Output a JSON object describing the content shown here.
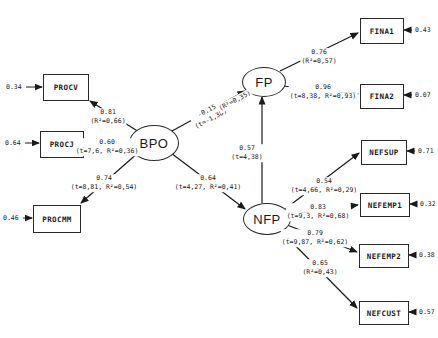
{
  "diagram": {
    "latent": {
      "bpo": {
        "label": "BPO"
      },
      "fp": {
        "label": "FP"
      },
      "nfp": {
        "label": "NFP"
      }
    },
    "observed": {
      "procv": {
        "label": "PROCV",
        "error": "0.34"
      },
      "procj": {
        "label": "PROCJ",
        "error": "0.64"
      },
      "procmm": {
        "label": "PROCMM",
        "error": "0.46"
      },
      "fina1": {
        "label": "FINA1",
        "error": "0.43"
      },
      "fina2": {
        "label": "FINA2",
        "error": "0.07"
      },
      "nefsup": {
        "label": "NEFSUP",
        "error": "0.71"
      },
      "nefemp1": {
        "label": "NEFEMP1",
        "error": "0.32"
      },
      "nefemp2": {
        "label": "NEFEMP2",
        "error": "0.38"
      },
      "nefcust": {
        "label": "NEFCUST",
        "error": "0.57"
      }
    },
    "paths": {
      "bpo_procv": {
        "coef": "0.81",
        "detail": "(R²=0,66)"
      },
      "bpo_procj": {
        "coef": "0.60",
        "detail": "(t=7,6, R²=0,36)"
      },
      "bpo_procmm": {
        "coef": "0.74",
        "detail": "(t=8,81, R²=0,54)"
      },
      "bpo_fp": {
        "coef": "-0.15",
        "detail": "(t=-1,38)"
      },
      "fp_rsq": {
        "detail": "(R²=0,35)"
      },
      "bpo_nfp": {
        "coef": "0.64",
        "detail": "(t=4,27, R²=0,41)"
      },
      "nfp_fp": {
        "coef": "0.57",
        "detail": "(t=4,38)"
      },
      "fp_fina1": {
        "coef": "0.76",
        "detail": "(R²=0,57)"
      },
      "fp_fina2": {
        "coef": "0.96",
        "detail": "(t=8,38, R²=0,93)"
      },
      "nfp_nefsup": {
        "coef": "0.54",
        "detail": "(t=4,66, R²=0,29)"
      },
      "nfp_nefemp1": {
        "coef": "0.83",
        "detail": "(t=9,3, R²=0,68)"
      },
      "nfp_nefemp2": {
        "coef": "0.79",
        "detail": "(t=9,87, R²=0,62)"
      },
      "nfp_nefcust": {
        "coef": "0.65",
        "detail": "(R²=0,43)"
      }
    }
  }
}
